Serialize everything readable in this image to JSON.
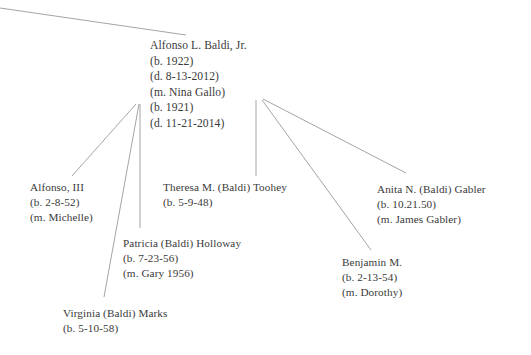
{
  "diagram": {
    "background_color": "#ffffff",
    "text_color": "#3a3a3a",
    "line_color": "#9a9a9a"
  },
  "people": {
    "root": {
      "name": "Alfonso L. Baldi, Jr.",
      "born": "(b. 1922)",
      "died": "(d. 8-13-2012)",
      "married": "(m. Nina Gallo)",
      "spouse_born": "(b. 1921)",
      "spouse_died": "(d. 11-21-2014)"
    },
    "alfonso_iii": {
      "name": "Alfonso, III",
      "born": "(b. 2-8-52)",
      "married": "(m. Michelle)"
    },
    "theresa": {
      "name": "Theresa M. (Baldi) Toohey",
      "born": "(b. 5-9-48)"
    },
    "anita": {
      "name": "Anita N. (Baldi) Gabler",
      "born": "(b. 10.21.50)",
      "married": "(m. James Gabler)"
    },
    "patricia": {
      "name": "Patricia (Baldi) Holloway",
      "born": "(b. 7-23-56)",
      "married": "(m. Gary 1956)"
    },
    "benjamin": {
      "name": "Benjamin M.",
      "born": "(b. 2-13-54)",
      "married": "(m. Dorothy)"
    },
    "virginia": {
      "name": "Virginia (Baldi) Marks",
      "born": "(b. 5-10-58)"
    }
  }
}
